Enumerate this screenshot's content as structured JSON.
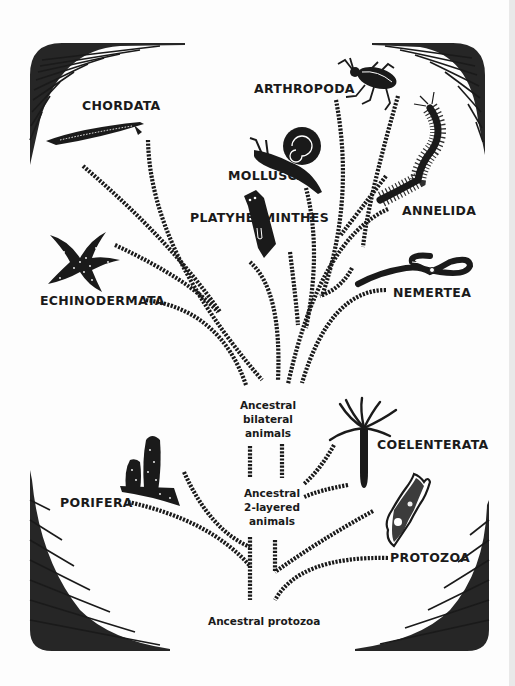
{
  "diagram": {
    "type": "phylogenetic-tree",
    "style": "black ink illustration with hatched branches and shaded corner ornaments",
    "colors": {
      "ink": "#1a1a1a",
      "background": "#fdfdfd",
      "edge_strip": "#e9e9e9"
    }
  },
  "phyla": {
    "chordata": "CHORDATA",
    "arthropoda": "ARTHROPODA",
    "mollusca": "MOLLUSCA",
    "platyhelminthes": "PLATYHELMINTHES",
    "annelida": "ANNELIDA",
    "echinodermata": "ECHINODERMATA",
    "nemertea": "NEMERTEA",
    "coelenterata": "COELENTERATA",
    "porifera": "PORIFERA",
    "protozoa": "PROTOZOA"
  },
  "ancestors": {
    "bilateral": {
      "line1": "Ancestral",
      "line2": "bilateral",
      "line3": "animals"
    },
    "two_layered": {
      "line1": "Ancestral",
      "line2": "2-layered",
      "line3": "animals"
    },
    "protozoa": {
      "line1": "Ancestral protozoa"
    }
  },
  "illustrations": [
    {
      "phylum": "CHORDATA",
      "icon": "lancelet-icon"
    },
    {
      "phylum": "ARTHROPODA",
      "icon": "beetle-icon"
    },
    {
      "phylum": "MOLLUSCA",
      "icon": "snail-icon"
    },
    {
      "phylum": "PLATYHELMINTHES",
      "icon": "flatworm-icon"
    },
    {
      "phylum": "ANNELIDA",
      "icon": "bristleworm-icon"
    },
    {
      "phylum": "ECHINODERMATA",
      "icon": "starfish-icon"
    },
    {
      "phylum": "NEMERTEA",
      "icon": "ribbonworm-icon"
    },
    {
      "phylum": "COELENTERATA",
      "icon": "hydra-icon"
    },
    {
      "phylum": "PORIFERA",
      "icon": "sponge-icon"
    },
    {
      "phylum": "PROTOZOA",
      "icon": "amoeba-icon"
    }
  ]
}
